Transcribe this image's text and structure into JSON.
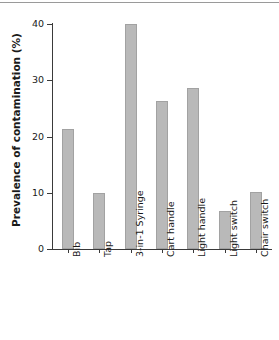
{
  "chart_data": {
    "type": "bar",
    "title": "",
    "xlabel": "",
    "ylabel": "Prevalence of contamination (%)",
    "categories": [
      "Bib",
      "Tap",
      "3-in-1 Syringe",
      "Cart handle",
      "Light handle",
      "Light switch",
      "Chair switch"
    ],
    "values": [
      21.3,
      9.9,
      40.0,
      26.3,
      28.6,
      6.8,
      10.1
    ],
    "ylim": [
      0,
      40
    ],
    "yticks": [
      0,
      10,
      20,
      30,
      40
    ],
    "ytick_labels": [
      "0",
      "10",
      "20",
      "30",
      "40"
    ],
    "grid": false,
    "legend": false,
    "bar_color": "#b9b9b9",
    "bar_edge_color": "#a2a2a2",
    "axis_color": "#3a3a3a",
    "text_color": "#1a1a1a",
    "background": "#ffffff"
  }
}
